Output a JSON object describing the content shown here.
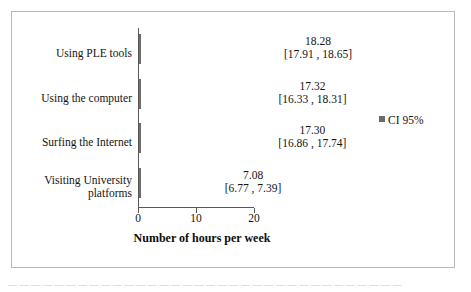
{
  "chart_data": {
    "type": "bar",
    "orientation": "horizontal",
    "title": "",
    "xlabel": "Number of hours per week",
    "ylabel": "",
    "xlim": [
      0,
      20
    ],
    "xticks": [
      "0",
      "10",
      "20"
    ],
    "grid": false,
    "legend": {
      "position": "right",
      "entries": [
        {
          "label": "CI 95%",
          "color": "#6b6b6b",
          "marker": "square"
        }
      ]
    },
    "bar_color": "#757575",
    "categories": [
      "Using PLE tools",
      "Using the computer",
      "Surfing the Internet",
      "Visiting University platforms"
    ],
    "values": [
      18.28,
      17.32,
      17.3,
      7.08
    ],
    "value_labels": [
      "18.28",
      "17.32",
      "17.30",
      "7.08"
    ],
    "ci_lower": [
      17.91,
      16.33,
      16.86,
      6.77
    ],
    "ci_upper": [
      18.65,
      18.31,
      17.74,
      7.39
    ],
    "ci_labels": [
      "[17.91 , 18.65]",
      "[16.33 , 18.31]",
      "[16.86 , 17.74]",
      "[6.77 , 7.39]"
    ]
  },
  "caption": {
    "text": "— — — — — — — — — — — — — — — — — — — — — — — — — — — — — — — — — —"
  }
}
